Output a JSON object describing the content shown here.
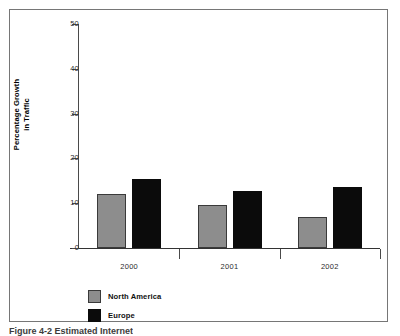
{
  "chart_data": {
    "type": "bar",
    "title": "",
    "xlabel": "",
    "ylabel": "Percentage Growth\nin Traffic",
    "ylabel_lines": [
      "Percentage Growth",
      "in Traffic"
    ],
    "categories": [
      "2000",
      "2001",
      "2002"
    ],
    "series": [
      {
        "name": "North America",
        "color": "#8d8d8d",
        "values": [
          12,
          9.6,
          7
        ]
      },
      {
        "name": "Europe",
        "color": "#0b0b0b",
        "values": [
          15.5,
          12.8,
          13.7
        ]
      }
    ],
    "ylim": [
      0,
      50
    ],
    "yticks": [
      0,
      10,
      20,
      30,
      40,
      50
    ],
    "ytick_labels": [
      "0",
      "10",
      "20",
      "30",
      "40",
      "50"
    ],
    "grid": false,
    "legend_position": "bottom-left"
  },
  "legend": {
    "items": [
      {
        "label": "North America",
        "swatch": "gray"
      },
      {
        "label": "Europe",
        "swatch": "black"
      }
    ]
  },
  "caption": {
    "text": "Figure 4-2   Estimated Internet"
  },
  "colors": {
    "series_north_america": "#8d8d8d",
    "series_europe": "#0b0b0b",
    "frame": "#767676",
    "axis": "#4a4a4a"
  }
}
